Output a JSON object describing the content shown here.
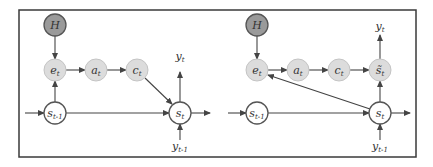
{
  "colors": {
    "frame": "#3a3a3a",
    "edge": "#444444",
    "hidden_node_fill": "#9a9a9a",
    "attention_node_fill": "#dcdcdc",
    "state_node_fill": "#ffffff",
    "node_stroke": "#555555"
  },
  "panels": [
    {
      "id": "left",
      "nodes": [
        {
          "id": "H",
          "main": "H",
          "sub": "",
          "x": 55,
          "y": 25,
          "kind": "hidden"
        },
        {
          "id": "e",
          "main": "e",
          "sub": "t",
          "x": 55,
          "y": 70,
          "kind": "attention"
        },
        {
          "id": "a",
          "main": "a",
          "sub": "t",
          "x": 96,
          "y": 70,
          "kind": "attention"
        },
        {
          "id": "c",
          "main": "c",
          "sub": "t",
          "x": 137,
          "y": 70,
          "kind": "attention"
        },
        {
          "id": "sprev",
          "main": "s",
          "sub": "t-1",
          "x": 55,
          "y": 113,
          "kind": "state"
        },
        {
          "id": "s",
          "main": "s",
          "sub": "t",
          "x": 180,
          "y": 113,
          "kind": "state"
        }
      ],
      "labels": [
        {
          "id": "yt",
          "main": "y",
          "sub": "t",
          "x": 180,
          "y": 60
        },
        {
          "id": "yprev",
          "main": "y",
          "sub": "t-1",
          "x": 180,
          "y": 150
        }
      ],
      "edges": [
        {
          "from": [
            55,
            36
          ],
          "to": [
            55,
            59
          ]
        },
        {
          "from": [
            66,
            70
          ],
          "to": [
            85,
            70
          ]
        },
        {
          "from": [
            107,
            70
          ],
          "to": [
            126,
            70
          ]
        },
        {
          "from": [
            145,
            78
          ],
          "to": [
            172,
            104
          ]
        },
        {
          "from": [
            55,
            102
          ],
          "to": [
            55,
            81
          ]
        },
        {
          "from": [
            25,
            113
          ],
          "to": [
            44,
            113
          ]
        },
        {
          "from": [
            66,
            113
          ],
          "to": [
            169,
            113
          ]
        },
        {
          "from": [
            180,
            102
          ],
          "to": [
            180,
            72
          ]
        },
        {
          "from": [
            191,
            113
          ],
          "to": [
            210,
            113
          ]
        },
        {
          "from": [
            180,
            140
          ],
          "to": [
            180,
            124
          ]
        }
      ]
    },
    {
      "id": "right",
      "nodes": [
        {
          "id": "H",
          "main": "H",
          "sub": "",
          "x": 257,
          "y": 25,
          "kind": "hidden"
        },
        {
          "id": "e",
          "main": "e",
          "sub": "t",
          "x": 257,
          "y": 70,
          "kind": "attention"
        },
        {
          "id": "a",
          "main": "a",
          "sub": "t",
          "x": 298,
          "y": 70,
          "kind": "attention"
        },
        {
          "id": "c",
          "main": "c",
          "sub": "t",
          "x": 339,
          "y": 70,
          "kind": "attention"
        },
        {
          "id": "stilde",
          "main": "s̃",
          "sub": "t",
          "x": 380,
          "y": 70,
          "kind": "attention"
        },
        {
          "id": "sprev",
          "main": "s",
          "sub": "t-1",
          "x": 257,
          "y": 113,
          "kind": "state"
        },
        {
          "id": "s",
          "main": "s",
          "sub": "t",
          "x": 380,
          "y": 113,
          "kind": "state"
        }
      ],
      "labels": [
        {
          "id": "yt",
          "main": "y",
          "sub": "t",
          "x": 380,
          "y": 30
        },
        {
          "id": "yprev",
          "main": "y",
          "sub": "t-1",
          "x": 380,
          "y": 150
        }
      ],
      "edges": [
        {
          "from": [
            257,
            36
          ],
          "to": [
            257,
            59
          ]
        },
        {
          "from": [
            268,
            70
          ],
          "to": [
            287,
            70
          ]
        },
        {
          "from": [
            309,
            70
          ],
          "to": [
            328,
            70
          ]
        },
        {
          "from": [
            350,
            70
          ],
          "to": [
            369,
            70
          ]
        },
        {
          "from": [
            370,
            109
          ],
          "to": [
            268,
            75
          ]
        },
        {
          "from": [
            228,
            113
          ],
          "to": [
            246,
            113
          ]
        },
        {
          "from": [
            268,
            113
          ],
          "to": [
            369,
            113
          ]
        },
        {
          "from": [
            380,
            102
          ],
          "to": [
            380,
            81
          ]
        },
        {
          "from": [
            380,
            59
          ],
          "to": [
            380,
            35
          ]
        },
        {
          "from": [
            391,
            113
          ],
          "to": [
            410,
            113
          ]
        },
        {
          "from": [
            380,
            140
          ],
          "to": [
            380,
            124
          ]
        }
      ]
    }
  ],
  "frame": {
    "x": 19,
    "y": 10,
    "w": 397,
    "h": 147
  },
  "node_radius": 11
}
